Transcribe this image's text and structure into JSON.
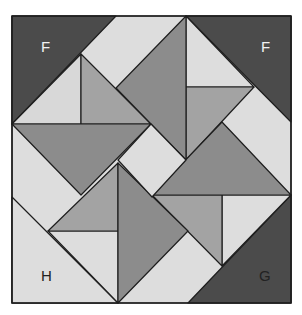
{
  "diagram": {
    "type": "quilt-block",
    "labels": {
      "top_left": "F",
      "top_right": "F",
      "bottom_left": "H",
      "bottom_right": "G"
    },
    "colors": {
      "dark": "#4b4b4b",
      "mid": "#8c8c8c",
      "medium": "#a3a3a3",
      "light": "#dddddd",
      "outline": "#1e1e1e",
      "label_on_dark": "#f2f2f2",
      "label_on_light": "#222222"
    }
  }
}
